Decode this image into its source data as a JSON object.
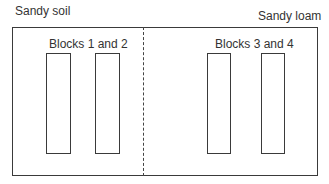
{
  "diagram": {
    "regions": [
      {
        "soil_label": "Sandy soil",
        "group_label": "Blocks 1 and 2"
      },
      {
        "soil_label": "Sandy loam",
        "group_label": "Blocks 3 and 4"
      }
    ]
  }
}
